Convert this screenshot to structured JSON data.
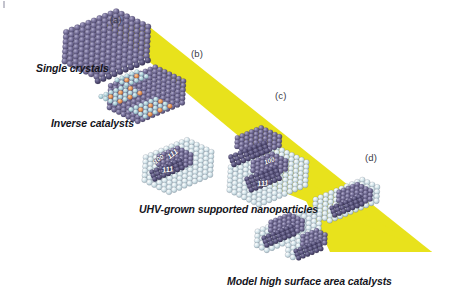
{
  "figure": {
    "type": "schematic-diagram",
    "background_color": "#ffffff",
    "band_color": "#e8e21c",
    "metal_color": "#6b6690",
    "oxide_color": "#d8e6ea",
    "dopant_color": "#e8a060"
  },
  "panel_labels": [
    {
      "id": "a",
      "text": "(a)",
      "x": 110,
      "y": 14
    },
    {
      "id": "b",
      "text": "(b)",
      "x": 191,
      "y": 48
    },
    {
      "id": "c",
      "text": "(c)",
      "x": 275,
      "y": 90
    },
    {
      "id": "d",
      "text": "(d)",
      "x": 365,
      "y": 152
    }
  ],
  "captions": [
    {
      "id": "single-crystals",
      "text": "Single crystals",
      "x": 36,
      "y": 62
    },
    {
      "id": "inverse-catalysts",
      "text": "Inverse catalysts",
      "x": 51,
      "y": 117
    },
    {
      "id": "uhv-nanoparticles",
      "text": "UHV-grown supported nanoparticles",
      "x": 139,
      "y": 203
    },
    {
      "id": "model-high-surface-area",
      "text": "Model high surface area catalysts",
      "x": 227,
      "y": 275
    }
  ],
  "facet_labels": [
    {
      "text": "100",
      "x": 160,
      "y": 161,
      "rotate": -38
    },
    {
      "text": "111",
      "x": 174,
      "y": 156,
      "rotate": -38
    },
    {
      "text": "111",
      "x": 168,
      "y": 172,
      "rotate": -8
    },
    {
      "text": "100",
      "x": 270,
      "y": 163,
      "rotate": -20
    },
    {
      "text": "111",
      "x": 263,
      "y": 186,
      "rotate": -6
    }
  ],
  "structures": [
    {
      "id": "single-crystal-slab",
      "kind": "hexagonal-metal-slab",
      "atoms": "purple"
    },
    {
      "id": "inverse-catalyst-slab",
      "kind": "metal-slab-with-oxide-islands",
      "atoms": "purple + light-blue oxide + orange dopants"
    },
    {
      "id": "uhv-support-left",
      "kind": "oxide-support-with-nanoparticle",
      "atoms": "light-blue oxide"
    },
    {
      "id": "uhv-support-right",
      "kind": "oxide-support-with-nanoparticles",
      "atoms": "light-blue oxide"
    },
    {
      "id": "high-surface-area-support",
      "kind": "irregular-oxide-support-with-nanoparticles",
      "atoms": "light-blue oxide"
    }
  ]
}
